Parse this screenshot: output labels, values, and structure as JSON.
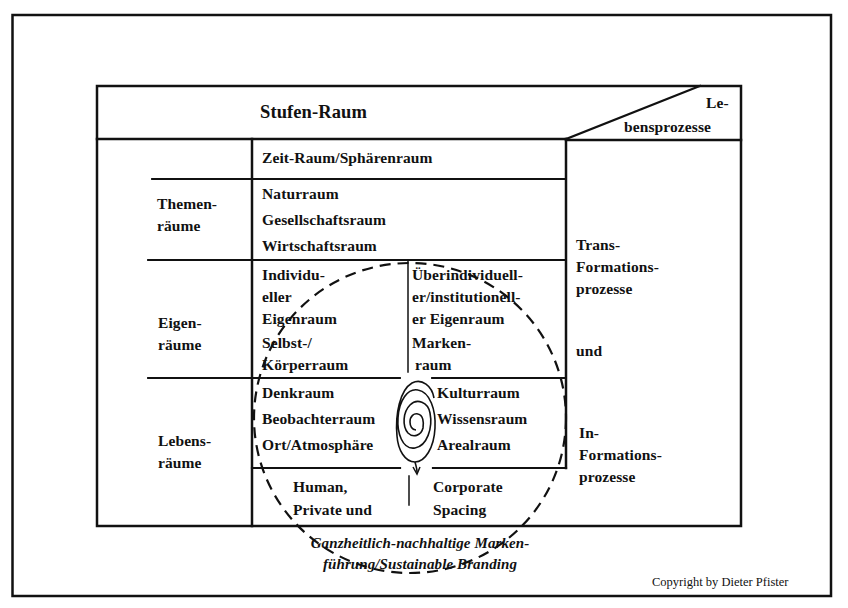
{
  "header": {
    "title": "Stufen-Raum",
    "corner_top": "Le-",
    "corner_bottom": "bensprozesse"
  },
  "rows": {
    "themen": {
      "label_lines": [
        "Themen-",
        "räume"
      ],
      "top_cell": "Zeit-Raum/Sphärenraum",
      "cell_lines": [
        "Naturraum",
        "Gesellschaftsraum",
        "Wirtschaftsraum"
      ]
    },
    "eigen": {
      "label_lines": [
        "Eigen-",
        "räume"
      ],
      "left_cell_lines": [
        "Individu-",
        "eller",
        "Eigenraum",
        "Selbst-/",
        "Körperraum"
      ],
      "right_cell_lines": [
        "Überindividuell-",
        "er/institutionell-",
        "er Eigenraum",
        "Marken-",
        "raum"
      ]
    },
    "lebens": {
      "label_lines": [
        "Lebens-",
        "räume"
      ],
      "left_cell_lines": [
        "Denkraum",
        "Beobachterraum",
        "Ort/Atmosphäre"
      ],
      "right_cell_lines": [
        "Kulturraum",
        "Wissensraum",
        "Arealraum"
      ],
      "bottom_left_lines": [
        "Human,",
        "Private und"
      ],
      "bottom_right_lines": [
        "Corporate",
        "Spacing"
      ]
    }
  },
  "processes": {
    "trans_lines": [
      "Trans-",
      "Formations-",
      "prozesse"
    ],
    "connector": "und",
    "in_lines": [
      "In-",
      "Formations-",
      "prozesse"
    ]
  },
  "caption": {
    "line1": "Ganzheitlich-nachhaltige Marken-",
    "line2": "führung/Sustainable Branding"
  },
  "copyright": "Copyright by Dieter Pfister",
  "icons": {
    "circle": "dashed-circle",
    "spiral": "spiral"
  },
  "colors": {
    "ink": "#111111",
    "background": "#ffffff"
  }
}
